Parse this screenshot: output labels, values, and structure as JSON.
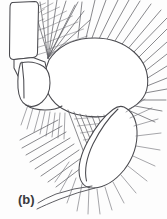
{
  "figure": {
    "panel_label": "(b)",
    "caption_text": "(b)",
    "background_color": "#fdfdfd",
    "outline_color": "#4a4a4f",
    "seta_color": "#5a5a60",
    "label_color": "#39393d",
    "width_px": 167,
    "height_px": 219
  },
  "structures": {
    "basal_segment": {
      "name": "basal-segment",
      "shape": "rounded-rectangle",
      "path": "M 12.5 2.5 L 34.5 1.5 Q 38.5 1.5 38.5 6.5 L 37.5 52.5 Q 37.5 57.0 33.0 57.5 L 14.0 59.5 Q 9.5 59.5 9.5 55.0 L 10.0 8.0 Q 10.0 3.0 12.5 2.5 Z"
    },
    "joint_segment": {
      "name": "joint-segment",
      "path": "M 14.0 59.5 L 33.0 57.5 L 45.0 62.0 L 47.0 72.0 L 36.0 78.0 L 18.0 76.0 L 14.0 68.0 Z"
    },
    "proximal_lobe": {
      "name": "proximal-lobe",
      "path": "M 20.5 63.0 Q 33.0 60.0 43.5 66.5 Q 50.0 71.0 50.0 83.0 Q 50.0 95.0 42.0 102.0 Q 33.5 109.0 26.0 105.0 Q 19.0 101.0 18.0 88.0 Q 17.2 74.0 20.5 63.0 Z"
    },
    "main_body": {
      "name": "main-body-oval",
      "path": "M 49.0 60.0 Q 62.0 40.5 88.0 38.3 Q 116.0 36.0 134.0 52.0 Q 149.5 66.0 147.5 85.5 Q 145.5 103.0 124.0 111.5 Q 101.0 120.5 77.0 114.5 Q 55.0 109.0 47.5 92.0 Q 41.5 76.0 49.0 60.0 Z"
    },
    "distal_lobe": {
      "name": "distal-leaf-lobe",
      "path": "M 124.0 107.0 Q 136.0 113.0 137.0 131.0 Q 138.0 152.0 124.0 170.0 Q 110.0 187.0 94.0 188.0 Q 82.0 188.5 79.5 176.0 Q 77.0 161.0 88.0 141.0 Q 99.5 119.5 113.0 109.5 Q 119.0 105.0 124.0 107.0 Z"
    },
    "inner_ridge": {
      "name": "inner-ridge-line",
      "path": "M 118.0 109.0 Q 104.0 122.0 93.0 144.0 Q 83.0 165.0 86.5 181.0"
    },
    "lower_margin": {
      "name": "lower-margin-line",
      "path": "M 47.5 92.0 Q 58.0 116.0 78.0 133.0 Q 94.0 147.0 104.0 162.0"
    }
  },
  "seta_groups": [
    {
      "name": "dorsal-plumose-fan",
      "count": 11,
      "type": "plumose",
      "region": "upper-left"
    },
    {
      "name": "dorsal-radiating-setae",
      "count": 18,
      "type": "simple",
      "region": "upper-right"
    },
    {
      "name": "ventral-plumose-patch",
      "count": 9,
      "type": "plumose",
      "region": "lower-center"
    },
    {
      "name": "ventral-marginal-setae",
      "count": 14,
      "type": "simple",
      "region": "lower-left"
    },
    {
      "name": "distal-lobe-setae",
      "count": 16,
      "type": "simple",
      "region": "lower-right"
    },
    {
      "name": "terminal-long-spine",
      "count": 1,
      "type": "long-spine",
      "region": "bottom"
    }
  ]
}
